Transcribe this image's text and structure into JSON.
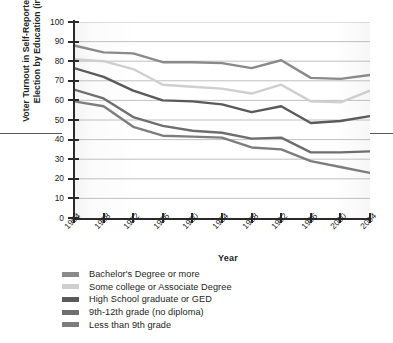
{
  "chart_data": {
    "type": "line",
    "title": "",
    "xlabel": "Year",
    "ylabel": "Voter Turnout in Self-Reported Presidential Election by Education (in percent)",
    "x": [
      1964,
      1968,
      1972,
      1976,
      1980,
      1984,
      1988,
      1992,
      1996,
      2000,
      2004
    ],
    "xtick_labels": [
      "1964",
      "1968",
      "1972",
      "1976",
      "1980",
      "1984",
      "1988",
      "1992",
      "1996",
      "2000",
      "2004"
    ],
    "ytick_labels": [
      "0",
      "10",
      "20",
      "30",
      "40",
      "50",
      "60",
      "70",
      "80",
      "90",
      "100"
    ],
    "yticks": [
      0,
      10,
      20,
      30,
      40,
      50,
      60,
      70,
      80,
      90,
      100
    ],
    "ylim": [
      0,
      100
    ],
    "xlim": [
      1964,
      2004
    ],
    "grid": "horizontal",
    "legend_position": "below-axes-left",
    "series": [
      {
        "name": "Bachelor's Degree or more",
        "color": "#8a8a8a",
        "values": [
          88,
          84.5,
          84,
          79.5,
          79.5,
          79,
          76.5,
          80.5,
          71.5,
          71,
          73
        ]
      },
      {
        "name": "Some college or Associate Degree",
        "color": "#cfcfcf",
        "values": [
          81,
          80,
          76,
          68,
          67,
          66,
          63.5,
          68,
          59.5,
          59,
          65
        ]
      },
      {
        "name": "High School graduate or GED",
        "color": "#5a5a5a",
        "values": [
          76.5,
          72,
          65,
          60,
          59.5,
          58,
          54,
          57,
          48.5,
          49.5,
          52
        ]
      },
      {
        "name": "9th-12th grade (no diploma)",
        "color": "#6e6e6e",
        "values": [
          65.5,
          61,
          51.5,
          47,
          44.5,
          43.5,
          40.5,
          41,
          33.5,
          33.5,
          34
        ]
      },
      {
        "name": "Less than 9th grade",
        "color": "#7d7d7d",
        "values": [
          59.5,
          57,
          46.5,
          42,
          41.5,
          41,
          36,
          35,
          29,
          26,
          23
        ]
      }
    ]
  },
  "axes": {
    "x_title": "Year",
    "y_title": "Voter Turnout in Self-Reported Presidential Election by Education (in percent)"
  },
  "legend": {
    "items": [
      {
        "label": "Bachelor's Degree or more",
        "color": "#8a8a8a"
      },
      {
        "label": "Some college or Associate Degree",
        "color": "#cfcfcf"
      },
      {
        "label": "High School graduate or GED",
        "color": "#5a5a5a"
      },
      {
        "label": "9th-12th grade (no diploma)",
        "color": "#6e6e6e"
      },
      {
        "label": "Less than 9th grade",
        "color": "#7d7d7d"
      }
    ]
  },
  "style": {
    "axis_color": "#2a2a2a",
    "grid_color": "#b9b9b9",
    "text_color": "#1d1d1d",
    "background": "#ffffff"
  }
}
